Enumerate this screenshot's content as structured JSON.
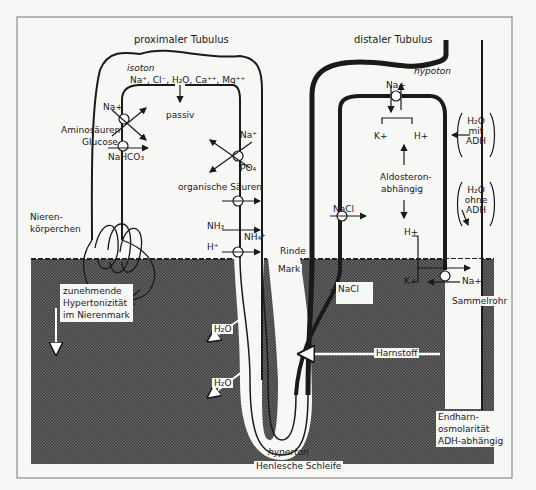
{
  "title_labels": {
    "proximal": "proximaler Tubulus",
    "distal": "distaler Tubulus"
  },
  "proximal": {
    "isoton": "isoton",
    "passive_ions": "Na⁺, Cl⁻, H₂O, Ca⁺⁺, Mg⁺⁺",
    "passiv": "passiv",
    "na_left": "Na+",
    "aminosaeuren": "Aminosäuren",
    "glucose": "Glucose",
    "nahco3": "NaHCO₃",
    "na_right": "Na⁺",
    "po4": "PO₄",
    "organische_saeuren": "organische Säuren",
    "nh3": "NH₃",
    "nh4": "NH₄⁺",
    "h_plus": "H⁺"
  },
  "glomerulus": {
    "line1": "Nieren-",
    "line2": "körperchen"
  },
  "distal": {
    "hypoton": "hypoton",
    "na_top": "Na+",
    "k_top": "K+",
    "h_top": "H+",
    "aldosteron1": "Aldosteron-",
    "aldosteron2": "abhängig",
    "h_bottom": "H+",
    "k_bottom": "K+",
    "na_bottom": "Na+",
    "nacl_cortex": "NaCl"
  },
  "collecting_duct": {
    "h2o_mit_1": "H₂O",
    "h2o_mit_2": "mit",
    "h2o_mit_3": "ADH",
    "h2o_ohne_1": "H₂O",
    "h2o_ohne_2": "ohne",
    "h2o_ohne_3": "ADH",
    "sammelrohr": "Sammelrohr",
    "endharn1": "Endharn-",
    "endharn2": "osmolarität",
    "endharn3": "ADH-abhängig"
  },
  "medulla": {
    "rinde": "Rinde",
    "mark": "Mark",
    "gradient1": "zunehmende",
    "gradient2": "Hypertonizität",
    "gradient3": "im Nierenmark",
    "h2o_1": "H₂O",
    "h2o_2": "H₂O",
    "nacl": "NaCl",
    "harnstoff": "Harnstoff",
    "hyperton": "hyperton",
    "henle": "Henlesche Schleife"
  },
  "colors": {
    "background": "#f7f7f5",
    "medulla": "#5a5a5a",
    "line": "#1a1a1a",
    "frame": "#777777"
  }
}
